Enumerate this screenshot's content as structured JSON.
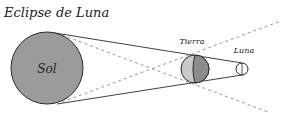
{
  "title": "Eclipse de Luna",
  "labels": {
    "sun": "Sol",
    "earth": "Tierra",
    "moon": "Luna"
  },
  "colors": {
    "sun_fill": "#9b9b9b",
    "earth_light": "#c9c9c9",
    "earth_dark": "#8c8c8c",
    "moon_fill": "#ffffff",
    "stroke": "#2a2a2a",
    "dashed": "#8a8a8a",
    "background": "#ffffff"
  },
  "bodies": {
    "sun": {
      "cx": 47,
      "cy": 68,
      "r": 36
    },
    "earth": {
      "cx": 195,
      "cy": 69,
      "r": 14
    },
    "moon": {
      "cx": 242,
      "cy": 69,
      "r": 6
    }
  }
}
